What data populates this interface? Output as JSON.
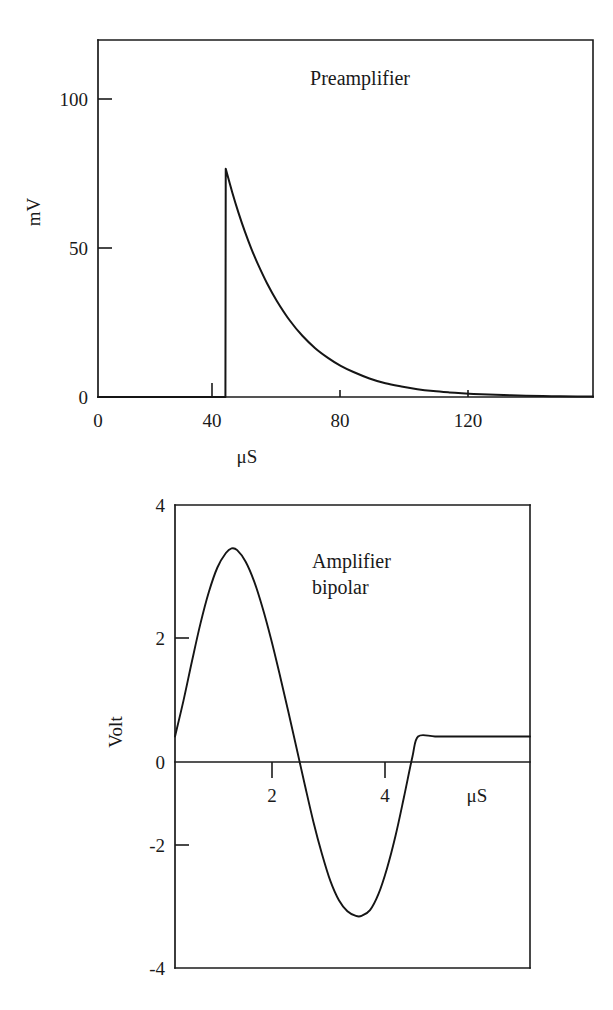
{
  "figure": {
    "caption_present": false,
    "background_color": "#ffffff",
    "ink_color": "#1a1a1a"
  },
  "chart_data": [
    {
      "id": "preamplifier",
      "type": "line",
      "title": "Preamplifier",
      "xlabel": "μS",
      "ylabel": "mV",
      "xlim": [
        0,
        155
      ],
      "ylim": [
        0,
        133
      ],
      "xticks": [
        0,
        40,
        80,
        120
      ],
      "xtick_labels": [
        "0",
        "40",
        "80",
        "120"
      ],
      "yticks": [
        0,
        50,
        100
      ],
      "ytick_labels": [
        "0",
        "50",
        "100"
      ],
      "grid": false,
      "legend": null,
      "frame": "box",
      "description": "Step rise at 40 microseconds to about 85 mV followed by single exponential decay with time constant near 18 microseconds, decaying to near 0 mV by 140 microseconds.",
      "series": [
        {
          "name": "preamplifier output",
          "x": [
            0,
            10,
            20,
            30,
            39.9,
            40,
            42,
            44,
            46,
            48,
            50,
            53,
            56,
            60,
            64,
            68,
            72,
            76,
            80,
            85,
            90,
            95,
            100,
            105,
            110,
            115,
            120,
            127,
            134,
            142,
            150,
            155
          ],
          "y": [
            0,
            0,
            0,
            0,
            0,
            85,
            76.4,
            68.6,
            61.6,
            55.3,
            49.7,
            42.2,
            35.8,
            28.6,
            22.8,
            18.2,
            14.6,
            11.6,
            9.3,
            6.9,
            5.1,
            3.9,
            2.9,
            2.2,
            1.7,
            1.3,
            1.0,
            0.7,
            0.5,
            0.3,
            0.2,
            0.15
          ]
        }
      ],
      "annotations": {
        "peak_value_mv": 85,
        "peak_time_us": 40,
        "decay_time_constant_us": 18
      }
    },
    {
      "id": "amplifier-bipolar",
      "type": "line",
      "title": "Amplifier bipolar",
      "title_line_1": "Amplifier",
      "title_line_2": "bipolar",
      "xlabel": "μS",
      "ylabel": "Volt",
      "xlim": [
        0,
        6.28
      ],
      "ylim": [
        -4,
        4
      ],
      "xticks": [
        2,
        4
      ],
      "xtick_labels": [
        "2",
        "4"
      ],
      "yticks": [
        -4,
        -2,
        0,
        2,
        4
      ],
      "ytick_labels": [
        "-4",
        "-2",
        "0",
        "2",
        "4"
      ],
      "grid": false,
      "legend": null,
      "frame": "box",
      "description": "Bipolar shaped pulse starting at 0 volt, rising to a positive peak of about 3.25 volt near 1.0 microsecond, crossing zero near 2.3 microseconds, reaching a negative trough of about -3.1 volt near 3.3 microseconds, and returning to 0 volt near 4.3 microseconds where it stays flat.",
      "series": [
        {
          "name": "amplifier bipolar output",
          "x": [
            0,
            0.15,
            0.3,
            0.45,
            0.6,
            0.75,
            0.9,
            1.0,
            1.1,
            1.25,
            1.4,
            1.55,
            1.7,
            1.85,
            2.0,
            2.15,
            2.3,
            2.45,
            2.6,
            2.75,
            2.9,
            3.05,
            3.2,
            3.3,
            3.45,
            3.6,
            3.75,
            3.9,
            4.05,
            4.2,
            4.3,
            4.6,
            5.0,
            5.5,
            6.0,
            6.28
          ],
          "y": [
            0,
            0.62,
            1.3,
            1.95,
            2.5,
            2.92,
            3.17,
            3.25,
            3.22,
            3.02,
            2.68,
            2.22,
            1.68,
            1.08,
            0.45,
            -0.2,
            -0.85,
            -1.48,
            -2.03,
            -2.5,
            -2.83,
            -3.02,
            -3.1,
            -3.1,
            -3.0,
            -2.72,
            -2.28,
            -1.72,
            -1.05,
            -0.35,
            0,
            0,
            0,
            0,
            0,
            0
          ]
        }
      ],
      "annotations": {
        "positive_peak_volt": 3.25,
        "positive_peak_time_us": 1.0,
        "zero_crossing_time_us": 2.3,
        "negative_trough_volt": -3.1,
        "negative_trough_time_us": 3.3,
        "return_to_zero_time_us": 4.3
      }
    }
  ]
}
